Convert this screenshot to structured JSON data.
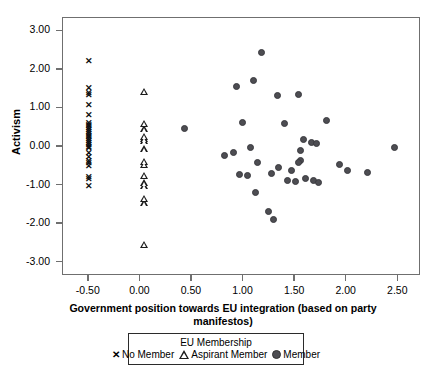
{
  "chart_data": {
    "type": "scatter",
    "title": "",
    "xlabel": "Government position towards EU integration (based on party manifestos)",
    "ylabel": "Activism",
    "xlim": [
      -0.75,
      2.72
    ],
    "ylim": [
      -3.35,
      3.35
    ],
    "grid": false,
    "legend_position": "bottom",
    "legend_title": "EU Membership",
    "xticks": [
      "-0.50",
      "0.00",
      "0.50",
      "1.00",
      "1.50",
      "2.00",
      "2.50"
    ],
    "xtick_values": [
      -0.5,
      0.0,
      0.5,
      1.0,
      1.5,
      2.0,
      2.5
    ],
    "yticks": [
      "3.00",
      "2.00",
      "1.00",
      "0.00",
      "-1.00",
      "-2.00",
      "-3.00"
    ],
    "ytick_values": [
      3,
      2,
      1,
      0,
      -1,
      -2,
      -3
    ],
    "series": [
      {
        "name": "No Member",
        "marker": "x",
        "color": "#111111",
        "points": [
          [
            -0.5,
            2.22
          ],
          [
            -0.5,
            1.52
          ],
          [
            -0.5,
            1.4
          ],
          [
            -0.5,
            1.33
          ],
          [
            -0.5,
            1.07
          ],
          [
            -0.5,
            0.83
          ],
          [
            -0.5,
            0.62
          ],
          [
            -0.5,
            0.57
          ],
          [
            -0.5,
            0.52
          ],
          [
            -0.5,
            0.47
          ],
          [
            -0.5,
            0.42
          ],
          [
            -0.5,
            0.37
          ],
          [
            -0.5,
            0.33
          ],
          [
            -0.5,
            0.28
          ],
          [
            -0.5,
            0.24
          ],
          [
            -0.5,
            0.19
          ],
          [
            -0.5,
            0.14
          ],
          [
            -0.5,
            0.09
          ],
          [
            -0.5,
            0.04
          ],
          [
            -0.5,
            0.0
          ],
          [
            -0.5,
            -0.05
          ],
          [
            -0.5,
            -0.16
          ],
          [
            -0.5,
            -0.26
          ],
          [
            -0.5,
            -0.38
          ],
          [
            -0.5,
            -0.44
          ],
          [
            -0.5,
            -0.5
          ],
          [
            -0.5,
            -0.78
          ],
          [
            -0.5,
            -0.85
          ],
          [
            -0.5,
            -1.02
          ]
        ]
      },
      {
        "name": "Aspirant Member",
        "marker": "triangle",
        "color": "#1a1a1a",
        "points": [
          [
            0.0,
            1.45
          ],
          [
            0.0,
            0.62
          ],
          [
            0.0,
            0.47
          ],
          [
            0.0,
            0.28
          ],
          [
            0.0,
            0.22
          ],
          [
            0.0,
            0.17
          ],
          [
            0.0,
            -0.04
          ],
          [
            0.0,
            -0.37
          ],
          [
            0.0,
            -0.45
          ],
          [
            0.0,
            -0.73
          ],
          [
            0.0,
            -0.93
          ],
          [
            0.0,
            -1.0
          ],
          [
            0.0,
            -1.33
          ],
          [
            0.0,
            -1.45
          ],
          [
            0.0,
            -2.52
          ]
        ]
      },
      {
        "name": "Member",
        "marker": "circle",
        "color": "#4d4d52",
        "points": [
          [
            1.17,
            2.45
          ],
          [
            1.1,
            1.72
          ],
          [
            0.93,
            1.57
          ],
          [
            1.33,
            1.33
          ],
          [
            1.53,
            1.37
          ],
          [
            0.43,
            0.49
          ],
          [
            0.99,
            0.64
          ],
          [
            1.4,
            0.62
          ],
          [
            1.8,
            0.69
          ],
          [
            1.58,
            0.2
          ],
          [
            1.66,
            0.12
          ],
          [
            1.71,
            0.1
          ],
          [
            1.55,
            -0.08
          ],
          [
            2.46,
            0.0
          ],
          [
            1.07,
            0.0
          ],
          [
            0.9,
            -0.14
          ],
          [
            0.82,
            -0.23
          ],
          [
            1.55,
            -0.35
          ],
          [
            1.53,
            -0.4
          ],
          [
            1.14,
            -0.39
          ],
          [
            1.34,
            -0.53
          ],
          [
            1.46,
            -0.62
          ],
          [
            1.27,
            -0.68
          ],
          [
            0.96,
            -0.72
          ],
          [
            1.04,
            -0.73
          ],
          [
            1.93,
            -0.46
          ],
          [
            2.01,
            -0.62
          ],
          [
            2.2,
            -0.66
          ],
          [
            1.6,
            -0.83
          ],
          [
            1.68,
            -0.87
          ],
          [
            1.73,
            -0.93
          ],
          [
            1.43,
            -0.88
          ],
          [
            1.5,
            -0.9
          ],
          [
            1.12,
            -1.18
          ],
          [
            1.24,
            -1.68
          ],
          [
            1.29,
            -1.88
          ]
        ]
      }
    ]
  },
  "legend": {
    "title": "EU Membership",
    "entries": [
      {
        "label": "No Member",
        "marker": "x"
      },
      {
        "label": "Aspirant Member",
        "marker": "triangle"
      },
      {
        "label": "Member",
        "marker": "circle"
      }
    ]
  },
  "axis": {
    "y_title": "Activism",
    "x_title_line1": "Government position towards EU integration (based on party",
    "x_title_line2": "manifestos)"
  }
}
